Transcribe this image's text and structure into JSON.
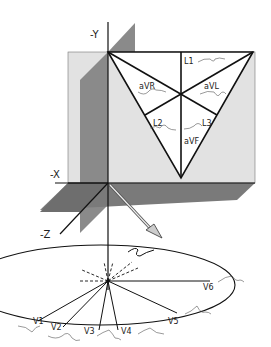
{
  "figure": {
    "type": "ecg-lead-axes-3d",
    "colors": {
      "background": "#ffffff",
      "frontal_plane": "#e2e2e2",
      "sagittal_plane": "#8a8a8a",
      "horizontal_plane": "#7a7a7a",
      "lines": "#111111"
    }
  },
  "axes": {
    "neg_y": "-Y",
    "neg_x": "-X",
    "neg_z": "-Z"
  },
  "frontal_leads": {
    "l1": "L1",
    "avr": "aVR",
    "avl": "aVL",
    "l2": "L2",
    "l3": "L3",
    "avf": "aVF"
  },
  "precordial_leads": {
    "v1": "V1",
    "v2": "V2",
    "v3": "V3",
    "v4": "V4",
    "v5": "V5",
    "v6": "V6"
  }
}
